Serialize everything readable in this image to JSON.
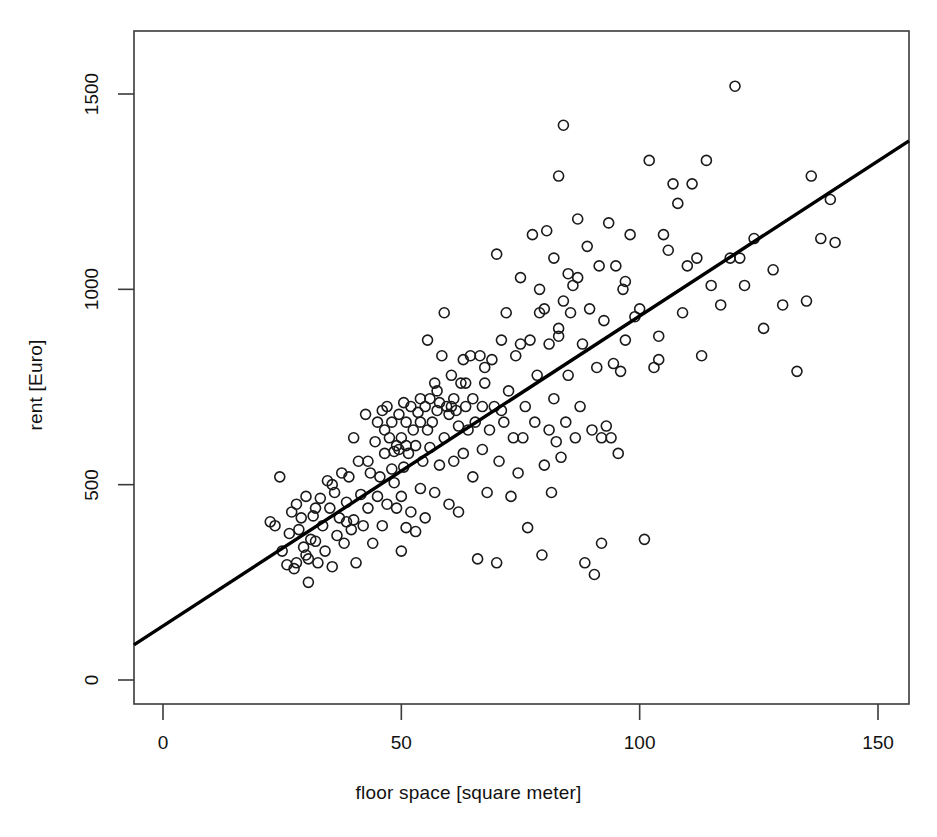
{
  "chart_data": {
    "type": "scatter",
    "title": "",
    "xlabel": "floor space [square meter]",
    "ylabel": "rent [Euro]",
    "xlim": [
      -6.1,
      156.5
    ],
    "ylim": [
      -60,
      1620
    ],
    "xticks": [
      0,
      50,
      100,
      150
    ],
    "yticks": [
      0,
      500,
      1000,
      1500
    ],
    "xtick_labels": [
      "0",
      "50",
      "100",
      "150"
    ],
    "ytick_labels": [
      "0",
      "500",
      "1000",
      "1500"
    ],
    "grid": false,
    "legend": null,
    "marker": {
      "shape": "open-circle",
      "radius_px": 5,
      "color": "#1a1a1a",
      "fill": "none",
      "stroke_width": 1.6
    },
    "series": [
      {
        "name": "apartments",
        "n_points": 236,
        "x": [
          22.5,
          23.5,
          24.5,
          25.0,
          26.0,
          26.5,
          27.0,
          27.5,
          28.0,
          28.0,
          28.5,
          29.0,
          29.5,
          30.0,
          30.0,
          30.5,
          31.0,
          31.5,
          32.0,
          32.5,
          33.0,
          33.5,
          34.0,
          34.5,
          35.0,
          35.5,
          36.0,
          36.5,
          37.0,
          37.5,
          38.0,
          38.5,
          39.0,
          39.5,
          40.0,
          40.0,
          40.5,
          41.0,
          41.5,
          42.0,
          42.5,
          43.0,
          43.5,
          44.0,
          44.5,
          45.0,
          45.0,
          45.5,
          46.0,
          46.0,
          46.5,
          47.0,
          47.0,
          47.5,
          48.0,
          48.0,
          48.5,
          48.5,
          49.0,
          49.0,
          49.5,
          49.5,
          50.0,
          50.0,
          50.0,
          50.5,
          50.5,
          51.0,
          51.0,
          51.5,
          52.0,
          52.0,
          52.5,
          53.0,
          53.0,
          53.5,
          54.0,
          54.0,
          54.5,
          55.0,
          55.0,
          55.5,
          55.5,
          56.0,
          56.0,
          56.5,
          57.0,
          57.0,
          57.5,
          58.0,
          58.0,
          58.5,
          59.0,
          59.0,
          59.5,
          60.0,
          60.0,
          60.5,
          61.0,
          61.0,
          61.5,
          62.0,
          62.0,
          62.5,
          63.0,
          63.0,
          63.5,
          64.0,
          64.5,
          65.0,
          65.0,
          65.5,
          66.0,
          66.5,
          67.0,
          67.0,
          67.5,
          68.0,
          68.5,
          69.0,
          69.5,
          70.0,
          70.0,
          70.5,
          71.0,
          71.5,
          72.0,
          72.5,
          73.0,
          73.5,
          74.0,
          74.5,
          75.0,
          75.5,
          76.0,
          76.5,
          77.0,
          77.5,
          78.0,
          78.5,
          79.0,
          79.5,
          80.0,
          80.0,
          80.5,
          81.0,
          81.0,
          81.5,
          82.0,
          82.0,
          82.5,
          83.0,
          83.0,
          83.5,
          84.0,
          84.0,
          84.5,
          85.0,
          85.0,
          85.5,
          86.0,
          86.5,
          87.0,
          87.5,
          88.0,
          88.5,
          89.0,
          89.5,
          90.0,
          90.5,
          91.0,
          91.5,
          92.0,
          92.5,
          93.0,
          93.5,
          94.0,
          94.5,
          95.0,
          95.5,
          96.0,
          96.5,
          97.0,
          98.0,
          99.0,
          100.0,
          101.0,
          102.0,
          103.0,
          104.0,
          105.0,
          106.0,
          107.0,
          108.0,
          109.0,
          110.0,
          111.0,
          112.0,
          113.0,
          114.0,
          115.0,
          117.0,
          119.0,
          120.0,
          121.0,
          122.0,
          124.0,
          126.0,
          128.0,
          130.0,
          133.0,
          135.0,
          136.0,
          138.0,
          140.0,
          141.0,
          30.5,
          32.0,
          35.5,
          38.5,
          43.0,
          46.5,
          51.0,
          54.0,
          57.5,
          60.5,
          63.5,
          67.5,
          71.0,
          75.0,
          79.0,
          83.0,
          87.0,
          92.0,
          97.0,
          104.0
        ],
        "y": [
          405,
          395,
          520,
          330,
          295,
          375,
          430,
          285,
          300,
          450,
          385,
          415,
          340,
          320,
          470,
          250,
          360,
          420,
          355,
          300,
          465,
          395,
          330,
          510,
          440,
          290,
          480,
          370,
          415,
          530,
          350,
          455,
          520,
          385,
          410,
          620,
          300,
          560,
          475,
          395,
          680,
          440,
          530,
          350,
          610,
          470,
          660,
          520,
          395,
          690,
          580,
          450,
          700,
          620,
          540,
          660,
          585,
          505,
          440,
          600,
          590,
          680,
          330,
          470,
          620,
          545,
          710,
          390,
          660,
          580,
          430,
          700,
          640,
          380,
          600,
          685,
          490,
          720,
          560,
          415,
          700,
          640,
          870,
          595,
          720,
          660,
          480,
          760,
          690,
          550,
          710,
          830,
          620,
          940,
          700,
          450,
          680,
          780,
          560,
          720,
          690,
          430,
          650,
          760,
          580,
          820,
          700,
          640,
          830,
          520,
          720,
          660,
          310,
          830,
          590,
          700,
          760,
          480,
          640,
          820,
          700,
          300,
          1090,
          560,
          870,
          660,
          940,
          740,
          470,
          620,
          830,
          530,
          1030,
          620,
          700,
          390,
          870,
          1140,
          660,
          780,
          1000,
          320,
          550,
          950,
          1150,
          640,
          860,
          480,
          720,
          1080,
          610,
          900,
          1290,
          570,
          970,
          1420,
          660,
          780,
          1040,
          940,
          1010,
          620,
          1180,
          700,
          860,
          300,
          1110,
          950,
          640,
          270,
          800,
          1060,
          350,
          920,
          650,
          1170,
          620,
          810,
          1060,
          580,
          790,
          1000,
          870,
          1140,
          930,
          950,
          360,
          1330,
          800,
          820,
          1140,
          1100,
          1270,
          1220,
          940,
          1060,
          1270,
          1080,
          830,
          1330,
          1010,
          960,
          1080,
          1520,
          1080,
          1010,
          1130,
          900,
          1050,
          960,
          790,
          970,
          1290,
          1130,
          1230,
          1120,
          310,
          440,
          500,
          405,
          560,
          640,
          600,
          660,
          740,
          700,
          760,
          800,
          690,
          860,
          940,
          880,
          1030,
          620,
          1020,
          880
        ]
      }
    ],
    "trend_line": {
      "type": "linear-regression",
      "intercept": 138,
      "slope": 7.93,
      "x_start": -6.1,
      "y_start": 90,
      "x_end": 156.5,
      "y_end": 1380,
      "color": "#000000",
      "width_px": 3.4
    }
  },
  "axes": {
    "box_color": "#3a3a3a",
    "tick_color": "#3a3a3a"
  }
}
